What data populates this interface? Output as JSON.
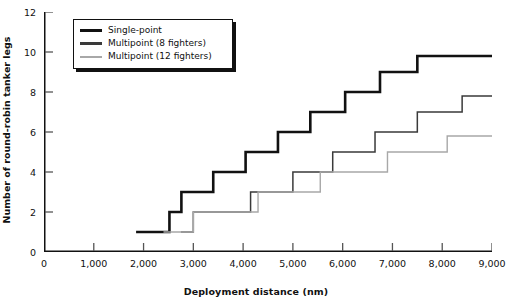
{
  "chart_data": {
    "type": "line",
    "subtype": "step",
    "title": "",
    "xlabel": "Deployment distance (nm)",
    "ylabel": "Number of round-robin tanker legs",
    "xlim": [
      0,
      9000
    ],
    "ylim": [
      0,
      12
    ],
    "xticks": [
      0,
      1000,
      2000,
      3000,
      4000,
      5000,
      6000,
      7000,
      8000,
      9000
    ],
    "xtick_labels": [
      "0",
      "1,000",
      "2,000",
      "3,000",
      "4,000",
      "5,000",
      "6,000",
      "7,000",
      "8,000",
      "9,000"
    ],
    "yticks": [
      0,
      2,
      4,
      6,
      8,
      10,
      12
    ],
    "ytick_labels": [
      "0",
      "2",
      "4",
      "6",
      "8",
      "10",
      "12"
    ],
    "grid": false,
    "legend_position": "top-left",
    "series": [
      {
        "name": "Single-point",
        "color": "#111111",
        "width": 2.6,
        "points": [
          [
            1850,
            1
          ],
          [
            2520,
            1
          ],
          [
            2520,
            2
          ],
          [
            2760,
            2
          ],
          [
            2760,
            3
          ],
          [
            3400,
            3
          ],
          [
            3400,
            4
          ],
          [
            4050,
            4
          ],
          [
            4050,
            5
          ],
          [
            4700,
            5
          ],
          [
            4700,
            6
          ],
          [
            5350,
            6
          ],
          [
            5350,
            7
          ],
          [
            6050,
            7
          ],
          [
            6050,
            8
          ],
          [
            6750,
            8
          ],
          [
            6750,
            9
          ],
          [
            7500,
            9
          ],
          [
            7500,
            9.8
          ],
          [
            9000,
            9.8
          ]
        ]
      },
      {
        "name": "Multipoint (8 fighters)",
        "color": "#3a3a3a",
        "width": 1.5,
        "points": [
          [
            2750,
            1
          ],
          [
            3000,
            1
          ],
          [
            3000,
            2
          ],
          [
            4150,
            2
          ],
          [
            4150,
            3
          ],
          [
            5000,
            3
          ],
          [
            5000,
            4
          ],
          [
            5800,
            4
          ],
          [
            5800,
            5
          ],
          [
            6650,
            5
          ],
          [
            6650,
            6
          ],
          [
            7500,
            6
          ],
          [
            7500,
            7
          ],
          [
            8400,
            7
          ],
          [
            8400,
            7.8
          ],
          [
            9000,
            7.8
          ]
        ]
      },
      {
        "name": "Multipoint (12 fighters)",
        "color": "#a8a8a8",
        "width": 1.4,
        "points": [
          [
            2400,
            1
          ],
          [
            3000,
            1
          ],
          [
            3000,
            2
          ],
          [
            4300,
            2
          ],
          [
            4300,
            3
          ],
          [
            5550,
            3
          ],
          [
            5550,
            4
          ],
          [
            6900,
            4
          ],
          [
            6900,
            5
          ],
          [
            8100,
            5
          ],
          [
            8100,
            5.8
          ],
          [
            9000,
            5.8
          ]
        ]
      }
    ],
    "legend": [
      {
        "label": "Single-point",
        "color": "#111111",
        "width": 3.2
      },
      {
        "label": "Multipoint (8 fighters)",
        "color": "#3a3a3a",
        "width": 2.4
      },
      {
        "label": "Multipoint (12 fighters)",
        "color": "#a8a8a8",
        "width": 2.0
      }
    ]
  },
  "axis_color": "#111111",
  "tick_color": "#555555"
}
